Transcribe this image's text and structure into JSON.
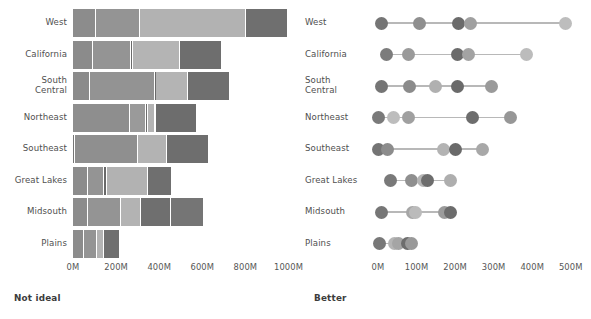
{
  "figure": {
    "left_panel": {
      "caption": "Not ideal",
      "chart_type": "bar"
    },
    "right_panel": {
      "caption": "Better",
      "chart_type": "scatter"
    }
  },
  "categories": [
    "West",
    "California",
    "South Central",
    "Northeast",
    "Southeast",
    "Great Lakes",
    "Midsouth",
    "Plains"
  ],
  "series_colors": [
    "#8a8a8a",
    "#999999",
    "#b3b3b3",
    "#6e6e6e"
  ],
  "chart_data": [
    {
      "type": "bar",
      "title": "Not ideal",
      "subtitle": "",
      "orientation": "horizontal",
      "stacked": true,
      "xlabel": "",
      "ylabel": "",
      "xlim": [
        0,
        1100
      ],
      "grid": false,
      "legend": "none",
      "tick_labels": [
        "0M",
        "200M",
        "400M",
        "600M",
        "800M",
        "1000M"
      ],
      "tick_values": [
        0,
        200,
        400,
        600,
        800,
        1000
      ],
      "categories": [
        "West",
        "California",
        "South Central",
        "Northeast",
        "Southeast",
        "Great Lakes",
        "Midsouth",
        "Plains"
      ],
      "series": [
        {
          "name": "Series 1",
          "color": "#8a8a8a",
          "values": [
            105,
            95,
            80,
            265,
            10
          ]
        },
        {
          "name": "Series 2",
          "color": "#999999",
          "values": [
            0,
            0,
            0,
            0,
            0
          ]
        },
        {
          "name": "Series 3",
          "color": "#b3b3b3",
          "values": [
            0,
            0,
            0,
            0,
            0
          ]
        },
        {
          "name": "Series 4",
          "color": "#6e6e6e",
          "values": [
            0,
            0,
            0,
            0,
            0
          ]
        }
      ],
      "stacks": [
        {
          "category": "West",
          "segments": [
            105,
            205,
            495,
            195
          ]
        },
        {
          "category": "California",
          "segments": [
            95,
            175,
            8,
            218,
            195
          ]
        },
        {
          "category": "South Central",
          "segments": [
            80,
            300,
            5,
            150,
            195
          ]
        },
        {
          "category": "Northeast",
          "segments": [
            265,
            75,
            8,
            35,
            195
          ]
        },
        {
          "category": "Southeast",
          "segments": [
            10,
            290,
            135,
            195
          ]
        },
        {
          "category": "Great Lakes",
          "segments": [
            70,
            75,
            12,
            190,
            115
          ]
        },
        {
          "category": "Midsouth",
          "segments": [
            70,
            155,
            90,
            140,
            155
          ]
        },
        {
          "category": "Plains",
          "segments": [
            50,
            60,
            35,
            75
          ]
        }
      ]
    },
    {
      "type": "scatter",
      "title": "Better",
      "subtitle": "",
      "orientation": "horizontal",
      "xlabel": "",
      "ylabel": "",
      "xlim": [
        0,
        540
      ],
      "grid": false,
      "legend": "none",
      "tick_labels": [
        "0M",
        "100M",
        "200M",
        "300M",
        "400M",
        "500M"
      ],
      "tick_values": [
        0,
        100,
        200,
        300,
        400,
        500
      ],
      "categories": [
        "West",
        "California",
        "South Central",
        "Northeast",
        "Southeast",
        "Great Lakes",
        "Midsouth",
        "Plains"
      ],
      "points": [
        {
          "category": "West",
          "values": [
            8,
            108,
            210,
            240,
            487
          ],
          "colors": [
            "#757575",
            "#8f8f8f",
            "#6b6b6b",
            "#a0a0a0",
            "#bdbdbd"
          ]
        },
        {
          "category": "California",
          "values": [
            22,
            78,
            205,
            235,
            385
          ],
          "colors": [
            "#7c7c7c",
            "#9a9a9a",
            "#6b6b6b",
            "#a3a3a3",
            "#bcbcbc"
          ]
        },
        {
          "category": "South Central",
          "values": [
            10,
            82,
            150,
            205,
            295
          ],
          "colors": [
            "#757575",
            "#8b8b8b",
            "#b0b0b0",
            "#6a6a6a",
            "#9a9a9a"
          ]
        },
        {
          "category": "Northeast",
          "values": [
            2,
            40,
            80,
            245,
            345
          ],
          "colors": [
            "#7a7a7a",
            "#bdbdbd",
            "#a0a0a0",
            "#6d6d6d",
            "#979797"
          ]
        },
        {
          "category": "Southeast",
          "values": [
            2,
            25,
            170,
            200,
            272
          ],
          "colors": [
            "#747474",
            "#8c8c8c",
            "#b3b3b3",
            "#6a6a6a",
            "#a8a8a8"
          ]
        },
        {
          "category": "Great Lakes",
          "values": [
            32,
            88,
            118,
            128,
            188
          ],
          "colors": [
            "#797979",
            "#8f8f8f",
            "#b5b5b5",
            "#6d6d6d",
            "#aeaeae"
          ]
        },
        {
          "category": "Midsouth",
          "values": [
            8,
            90,
            96,
            172,
            188
          ],
          "colors": [
            "#767676",
            "#a6a6a6",
            "#bbbbbb",
            "#9b9b9b",
            "#6c6c6c"
          ]
        },
        {
          "category": "Plains",
          "values": [
            5,
            42,
            52,
            76,
            86
          ],
          "colors": [
            "#787878",
            "#b5b5b5",
            "#a5a5a5",
            "#6d6d6d",
            "#999999"
          ]
        }
      ]
    }
  ]
}
